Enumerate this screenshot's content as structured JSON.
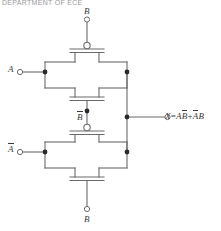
{
  "page": {
    "caption": "DEPARTMENT OF ECE",
    "width": 221,
    "height": 231
  },
  "colors": {
    "wire": "#6b6b6b",
    "text": "#3a3a3a",
    "node": "#2a2a2a",
    "background": "#ffffff",
    "caption": "#9a9a9a"
  },
  "circuit": {
    "type": "cmos-transmission-gate-xor",
    "inputs": [
      {
        "id": "in-b-top",
        "label": "B",
        "overbar": false,
        "terminal": "open-circle",
        "position": "top"
      },
      {
        "id": "in-a",
        "label": "A",
        "overbar": false,
        "terminal": "open-circle",
        "position": "left-upper"
      },
      {
        "id": "in-bbar-mid",
        "label": "B",
        "overbar": true,
        "terminal": "open-circle",
        "position": "middle"
      },
      {
        "id": "in-abar",
        "label": "A",
        "overbar": true,
        "terminal": "open-circle",
        "position": "left-lower"
      },
      {
        "id": "in-b-bottom",
        "label": "B",
        "overbar": false,
        "terminal": "open-circle",
        "position": "bottom"
      }
    ],
    "output": {
      "id": "out-x",
      "terminal": "open-circle",
      "equation_parts": [
        {
          "text": "X",
          "italic": true,
          "overbar": false
        },
        {
          "text": "=",
          "italic": false,
          "overbar": false
        },
        {
          "text": "A",
          "italic": true,
          "overbar": false
        },
        {
          "text": "B",
          "italic": true,
          "overbar": true
        },
        {
          "text": "+",
          "italic": false,
          "overbar": false
        },
        {
          "text": "A",
          "italic": true,
          "overbar": true
        },
        {
          "text": "B",
          "italic": true,
          "overbar": false
        }
      ],
      "equation_plain": "X=AB̅+A̅B"
    },
    "gates": [
      {
        "id": "tg-upper",
        "name": "upper-transmission-gate",
        "nmos_gate": "B-bar",
        "pmos_gate": "B (bubble)"
      },
      {
        "id": "tg-lower",
        "name": "lower-transmission-gate",
        "nmos_gate": "B-bar (bubble)",
        "pmos_gate": "B"
      }
    ],
    "nodes": [
      {
        "id": "node-a-in",
        "x": 45,
        "y": 72
      },
      {
        "id": "node-abar-in",
        "x": 45,
        "y": 152
      },
      {
        "id": "node-out-up",
        "x": 127,
        "y": 72
      },
      {
        "id": "node-out-dn",
        "x": 127,
        "y": 152
      },
      {
        "id": "node-out",
        "x": 146,
        "y": 117
      },
      {
        "id": "node-bbar",
        "x": 87,
        "y": 111
      },
      {
        "id": "node-bbar2",
        "x": 87,
        "y": 117
      }
    ]
  },
  "labels": {
    "b_top": "B",
    "a_left": "A",
    "b_bar_mid": "B",
    "a_bar_left": "A",
    "b_bottom": "B"
  }
}
